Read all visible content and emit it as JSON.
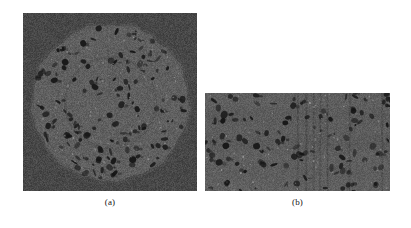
{
  "figure": {
    "type": "microscopy-figure",
    "background_color": "#ffffff",
    "width": 411,
    "height": 228,
    "panels": [
      {
        "id": "a",
        "caption": "(a)",
        "kind": "cross-section-tomography-slice",
        "shape": "square-with-inscribed-circular-specimen",
        "x": 23,
        "y": 13,
        "width": 174,
        "height": 178,
        "background_color": "#474747",
        "specimen_color": "#5f5f5f",
        "pore_color": "#151515",
        "highlight_color": "#b9b9b9",
        "circle_center_x": 0.5,
        "circle_center_y": 0.5,
        "circle_radius": 0.455,
        "inner_arc_radius": 0.26,
        "grain_strength": 22,
        "pore_count": 150,
        "speck_count": 110,
        "seed": 20471
      },
      {
        "id": "b",
        "caption": "(b)",
        "kind": "longitudinal-section-tomography-slice",
        "shape": "rectangular",
        "x": 205,
        "y": 93,
        "width": 185,
        "height": 98,
        "background_color": "#5d5d5d",
        "specimen_color": "#5d5d5d",
        "pore_color": "#141414",
        "highlight_color": "#bdbdbd",
        "grain_strength": 20,
        "pore_count": 120,
        "speck_count": 95,
        "vertical_streak_positions": [
          0.5,
          0.545,
          0.585,
          0.62,
          0.66,
          0.78,
          0.955
        ],
        "seed": 88123
      }
    ]
  },
  "captions": {
    "a": "(a)",
    "b": "(b)"
  }
}
